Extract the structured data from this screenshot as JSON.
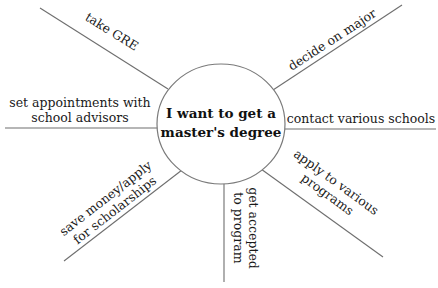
{
  "center": {
    "line1": "I want to get a",
    "line2": "master's degree"
  },
  "branches": [
    {
      "id": "take-gre",
      "lines": [
        "take GRE"
      ]
    },
    {
      "id": "decide-major",
      "lines": [
        "decide on major"
      ]
    },
    {
      "id": "set-appointments",
      "lines": [
        "set appointments with",
        "school advisors"
      ]
    },
    {
      "id": "contact-schools",
      "lines": [
        "contact various schools"
      ]
    },
    {
      "id": "save-money",
      "lines": [
        "save money/apply",
        "for scholarships"
      ]
    },
    {
      "id": "get-accepted",
      "lines": [
        "get accepted",
        "to program"
      ]
    },
    {
      "id": "apply-programs",
      "lines": [
        "apply to various",
        "programs"
      ]
    }
  ],
  "colors": {
    "line": "#6e6e6e",
    "text": "#1a1a1a",
    "background": "#ffffff"
  }
}
